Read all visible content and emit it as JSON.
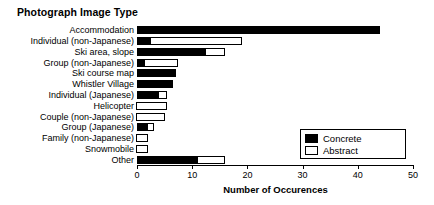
{
  "chart_data": {
    "type": "bar",
    "orientation": "horizontal",
    "stacked": true,
    "title": "Photograph Image Type",
    "xlabel": "Number of Occurences",
    "ylabel": "",
    "xlim": [
      0,
      50
    ],
    "xticks": [
      0,
      10,
      20,
      30,
      40,
      50
    ],
    "xtick_labels": [
      "0",
      "10",
      "20",
      "30",
      "40",
      "50"
    ],
    "grid": false,
    "legend_position": "bottom-right",
    "categories": [
      "Accommodation",
      "Individual (non-Japanese)",
      "Ski area, slope",
      "Group (non-Japanese)",
      "Ski course map",
      "Whistler Village",
      "Individual (Japanese)",
      "Helicopter",
      "Couple (non-Japanese)",
      "Group (Japanese)",
      "Family (non-Japanese)",
      "Snowmobile",
      "Other"
    ],
    "series": [
      {
        "name": "Concrete",
        "color": "#000000",
        "values": [
          44,
          2.5,
          12.5,
          1.5,
          7,
          6.5,
          4,
          0,
          0,
          2,
          0,
          0,
          11
        ]
      },
      {
        "name": "Abstract",
        "color": "#ffffff",
        "values": [
          0,
          16.5,
          3.5,
          6,
          0,
          0,
          1.5,
          5.5,
          5,
          1,
          2,
          2,
          5
        ]
      }
    ],
    "totals": [
      44,
      19,
      16,
      7.5,
      7,
      6.5,
      5.5,
      5.5,
      5,
      3,
      2,
      2,
      16
    ]
  },
  "legend": {
    "items": [
      {
        "label": "Concrete",
        "swatch": "#000000"
      },
      {
        "label": "Abstract",
        "swatch": "#ffffff"
      }
    ]
  }
}
